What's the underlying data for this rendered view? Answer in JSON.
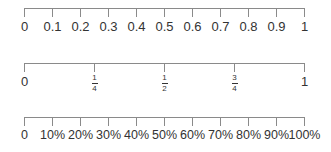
{
  "lines": [
    {
      "name": "decimal-number-line",
      "ticks": [
        "0",
        "0.1",
        "0.2",
        "0.3",
        "0.4",
        "0.5",
        "0.6",
        "0.7",
        "0.8",
        "0.9",
        "1"
      ]
    },
    {
      "name": "fraction-number-line",
      "ticks": [
        {
          "type": "whole",
          "text": "0"
        },
        {
          "type": "fraction",
          "num": "1",
          "den": "4"
        },
        {
          "type": "fraction",
          "num": "1",
          "den": "2"
        },
        {
          "type": "fraction",
          "num": "3",
          "den": "4"
        },
        {
          "type": "whole",
          "text": "1"
        }
      ]
    },
    {
      "name": "percent-number-line",
      "ticks": [
        "0",
        "10%",
        "20%",
        "30%",
        "40%",
        "50%",
        "60%",
        "70%",
        "80%",
        "90%",
        "100%"
      ]
    }
  ],
  "style": {
    "line_color": "#8a8a8a",
    "text_color": "#333333"
  }
}
